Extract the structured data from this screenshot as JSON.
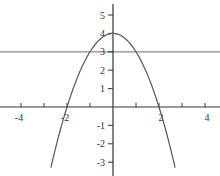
{
  "chart_data": {
    "type": "line",
    "title": "",
    "xlabel": "",
    "ylabel": "",
    "xlim": [
      -4.9,
      4.6
    ],
    "ylim": [
      -3.7,
      5.8
    ],
    "grid": false,
    "x_ticks": [
      -4,
      -3,
      -2,
      -1,
      1,
      2,
      3,
      4
    ],
    "x_tick_labels": [
      "-4",
      "-2",
      "2",
      "4"
    ],
    "y_ticks": [
      -3,
      -2,
      -1,
      1,
      2,
      3,
      4,
      5
    ],
    "y_tick_labels": [
      "-3",
      "-2",
      "-1",
      "1",
      "2",
      "3",
      "4",
      "5"
    ],
    "series": [
      {
        "name": "y = 4 - x^2",
        "function": "4 - x^2",
        "x": [
          -2.7,
          -2,
          -1,
          0,
          1,
          2,
          2.7
        ],
        "y": [
          -3.29,
          0,
          3,
          4,
          3,
          0,
          -3.29
        ],
        "color": "#555555"
      },
      {
        "name": "y = 3",
        "function": "3",
        "x": [
          -4.9,
          4.6
        ],
        "y": [
          3,
          3
        ],
        "color": "#888888"
      }
    ]
  },
  "axes": {
    "color": "#333333"
  }
}
